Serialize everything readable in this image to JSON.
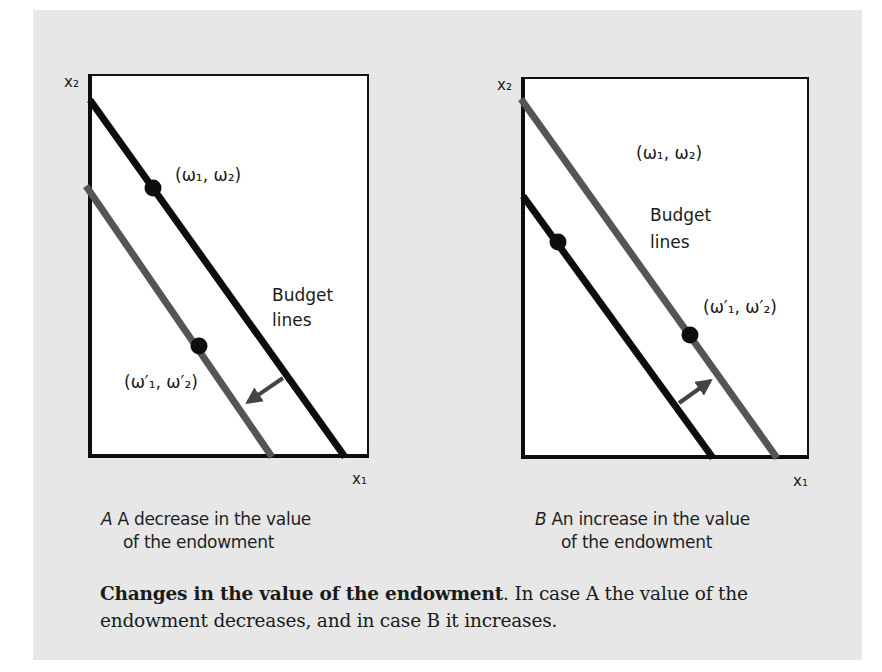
{
  "figure": {
    "panel_background": "#e7e7e7",
    "panels": [
      {
        "id": "A",
        "axis_x_label": "x₁",
        "axis_y_label": "x₂",
        "endowment_label": "(ω₁, ω₂)",
        "new_endowment_label": "(ω′₁, ω′₂)",
        "budget_label_line1": "Budget",
        "budget_label_line2": "lines",
        "caption_letter": "A",
        "caption_line1": "A decrease in the value",
        "caption_line2": "of the endowment",
        "shift_direction": "inward"
      },
      {
        "id": "B",
        "axis_x_label": "x₁",
        "axis_y_label": "x₂",
        "endowment_label": "(ω₁, ω₂)",
        "new_endowment_label": "(ω′₁, ω′₂)",
        "budget_label_line1": "Budget",
        "budget_label_line2": "lines",
        "caption_letter": "B",
        "caption_line1": "An increase in the value",
        "caption_line2": "of the endowment",
        "shift_direction": "outward"
      }
    ],
    "caption": {
      "title": "Changes in the value of the endowment",
      "title_suffix": ".",
      "body": " In case A the value of the endowment decreases, and in case B it increases."
    },
    "colors": {
      "original_line": "#0d0d0d",
      "new_line": "#555555",
      "arrow": "#444444",
      "axis": "#111111",
      "plot_background": "#ffffff"
    }
  }
}
